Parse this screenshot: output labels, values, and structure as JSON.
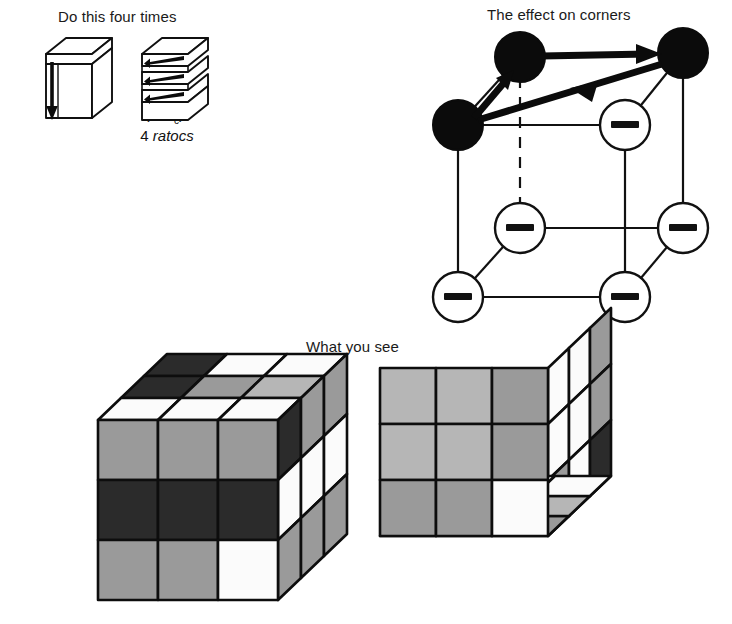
{
  "figure": {
    "captions": {
      "do_this": "Do this four times",
      "corners": "The effect on corners",
      "what_you_see": "What you see"
    },
    "formula": {
      "expression_prefix": "(R",
      "prime": "′",
      "letter_t": "T",
      "subscript_c": "c",
      "close_paren": ")",
      "exponent": "4",
      "subtitle_count": "4 ",
      "subtitle_word": "ratocs"
    }
  },
  "move_diagram": {
    "left_cube": {
      "name": "whole-cube-with-down-arrow",
      "arrow_direction": "down",
      "arrow_count": 1
    },
    "right_cube": {
      "name": "sliced-cube-with-left-arrows",
      "arrow_direction": "left",
      "arrow_count": 3,
      "slice_count": 3
    }
  },
  "corner_diagram": {
    "type": "cube-graph",
    "filled_label": "",
    "minus_label": "−",
    "vertices": [
      {
        "id": "top-back-left",
        "x": 520,
        "y": 57,
        "state": "filled"
      },
      {
        "id": "top-back-right",
        "x": 683,
        "y": 53,
        "state": "filled"
      },
      {
        "id": "top-front-left",
        "x": 458,
        "y": 125,
        "state": "filled"
      },
      {
        "id": "top-front-right",
        "x": 625,
        "y": 125,
        "state": "minus"
      },
      {
        "id": "bottom-back-left",
        "x": 520,
        "y": 228,
        "state": "minus"
      },
      {
        "id": "bottom-back-right",
        "x": 683,
        "y": 228,
        "state": "minus"
      },
      {
        "id": "bottom-front-left",
        "x": 458,
        "y": 297,
        "state": "minus"
      },
      {
        "id": "bottom-front-right",
        "x": 625,
        "y": 297,
        "state": "minus"
      }
    ],
    "arrows": [
      {
        "from": "top-back-left",
        "to": "top-back-right",
        "style": "double-head"
      },
      {
        "from": "top-back-right",
        "to": "top-front-left",
        "style": "double-head"
      },
      {
        "from": "top-front-left",
        "to": "top-back-left",
        "style": "double-head"
      }
    ]
  },
  "result_cubes": {
    "left_cube": {
      "name": "left-result-cube",
      "view": "front-top-right",
      "front": [
        [
          "gray",
          "gray",
          "gray"
        ],
        [
          "dark",
          "dark",
          "dark"
        ],
        [
          "gray",
          "gray",
          "white"
        ]
      ],
      "top": [
        [
          "dark",
          "white",
          "white"
        ],
        [
          "dark",
          "gray",
          "lightgray"
        ],
        [
          "white",
          "white",
          "white"
        ]
      ],
      "right": [
        [
          "dark",
          "white",
          "gray"
        ],
        [
          "gray",
          "white",
          "gray"
        ],
        [
          "gray",
          "white",
          "gray"
        ]
      ]
    },
    "right_cube": {
      "name": "right-result-cube",
      "view": "front-bottom-right",
      "front": [
        [
          "lightgray",
          "lightgray",
          "gray"
        ],
        [
          "lightgray",
          "lightgray",
          "gray"
        ],
        [
          "gray",
          "gray",
          "white"
        ]
      ],
      "bottom": [
        [
          "white",
          "white",
          "gray"
        ],
        [
          "dark",
          "gray",
          "lightgray"
        ],
        [
          "dark",
          "white",
          "white"
        ]
      ],
      "right": [
        [
          "white",
          "white",
          "gray"
        ],
        [
          "white",
          "white",
          "white"
        ],
        [
          "gray",
          "gray",
          "dark"
        ]
      ]
    }
  },
  "palette": {
    "white": "#fbfbfb",
    "lightgray": "#b6b6b6",
    "gray": "#9a9a9a",
    "dark": "#2b2b2b",
    "outline": "#0d0d0d",
    "background": "#ffffff"
  }
}
